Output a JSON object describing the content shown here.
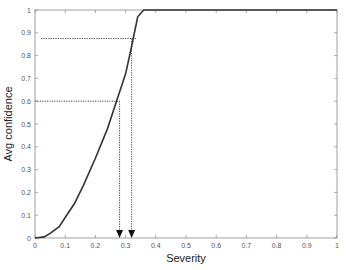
{
  "chart_data": {
    "type": "line",
    "title": "",
    "xlabel": "Severity",
    "ylabel": "Avg confidence",
    "xlim": [
      0,
      1
    ],
    "ylim": [
      0,
      1
    ],
    "xticks": [
      "0",
      "0.1",
      "0.2",
      "0.3",
      "0.4",
      "0.5",
      "0.6",
      "0.7",
      "0.8",
      "0.9",
      "1"
    ],
    "yticks": [
      "0",
      "0.1",
      "0.2",
      "0.3",
      "0.4",
      "0.5",
      "0.6",
      "0.7",
      "0.8",
      "0.9",
      "1"
    ],
    "grid": false,
    "legend": null,
    "series": [
      {
        "name": "Avg confidence",
        "x": [
          0,
          0.03,
          0.05,
          0.08,
          0.1,
          0.13,
          0.16,
          0.2,
          0.24,
          0.27,
          0.3,
          0.32,
          0.34,
          0.36,
          0.4,
          0.5,
          0.6,
          0.7,
          0.8,
          0.9,
          1.0
        ],
        "y": [
          0,
          0.005,
          0.02,
          0.05,
          0.09,
          0.15,
          0.23,
          0.35,
          0.48,
          0.6,
          0.72,
          0.84,
          0.97,
          1.0,
          1.0,
          1.0,
          1.0,
          1.0,
          1.0,
          1.0,
          1.0
        ]
      }
    ],
    "annotations": [
      {
        "type": "dotted-guide",
        "y": 0.6,
        "x_from": 0.0,
        "x_to": 0.28,
        "arrow_down_at_x": 0.28
      },
      {
        "type": "dotted-guide",
        "y": 0.875,
        "x_from": 0.02,
        "x_to": 0.335,
        "arrow_down_at_x": 0.32
      }
    ]
  }
}
